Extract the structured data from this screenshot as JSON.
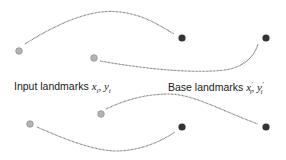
{
  "labels": {
    "input": {
      "text": "Input landmarks ",
      "math_x": "x",
      "math_x_sub": "i",
      "sep": ", ",
      "math_y": "y",
      "math_y_sub": "i"
    },
    "base": {
      "text": "Base landmarks ",
      "math_x": "x",
      "math_x_sup": "′",
      "math_x_sub": "i",
      "sep": ", ",
      "math_y": "y",
      "math_y_sup": "′",
      "math_y_sub": "i"
    }
  },
  "colors": {
    "input_dot": "#b3b3b3",
    "input_dot_stroke": "#8c8c8c",
    "base_dot": "#333333",
    "curve": "#666666"
  },
  "points": {
    "input": [
      {
        "x": 19,
        "y": 51
      },
      {
        "x": 94,
        "y": 58
      },
      {
        "x": 30,
        "y": 124
      },
      {
        "x": 101,
        "y": 114
      }
    ],
    "base": [
      {
        "x": 182,
        "y": 38
      },
      {
        "x": 266,
        "y": 38
      },
      {
        "x": 182,
        "y": 127
      },
      {
        "x": 266,
        "y": 127
      }
    ]
  }
}
